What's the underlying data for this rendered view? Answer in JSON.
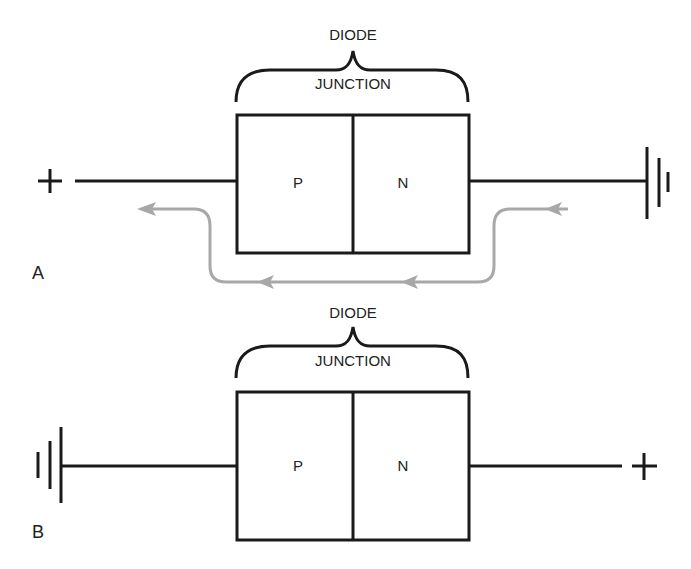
{
  "figure": {
    "panels": [
      {
        "id": "A",
        "panel_label": "A",
        "top_label": "DIODE",
        "brace_label": "JUNCTION",
        "left_region": "P",
        "right_region": "N",
        "left_terminal": "+",
        "right_terminal": "ground",
        "current_flow": "arrows indicate flow from right terminal around beneath diode to left terminal"
      },
      {
        "id": "B",
        "panel_label": "B",
        "top_label": "DIODE",
        "brace_label": "JUNCTION",
        "left_region": "P",
        "right_region": "N",
        "left_terminal": "ground",
        "right_terminal": "+"
      }
    ],
    "colors": {
      "line": "#1a1a1a",
      "flow": "#a8a8a8"
    }
  }
}
